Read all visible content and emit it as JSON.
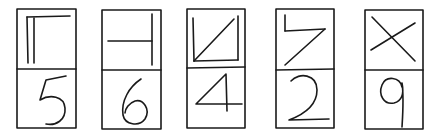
{
  "stroke_color": "#1a1a1a",
  "background": "#ffffff",
  "cards": [
    {
      "symbol": "double-vertical-with-top-bar",
      "digit": "5"
    },
    {
      "symbol": "horizontal-line-into-vertical",
      "digit": "6"
    },
    {
      "symbol": "open-box-with-diagonal",
      "digit": "4"
    },
    {
      "symbol": "reversed-z-shape",
      "digit": "2"
    },
    {
      "symbol": "x-cross",
      "digit": "9"
    }
  ]
}
